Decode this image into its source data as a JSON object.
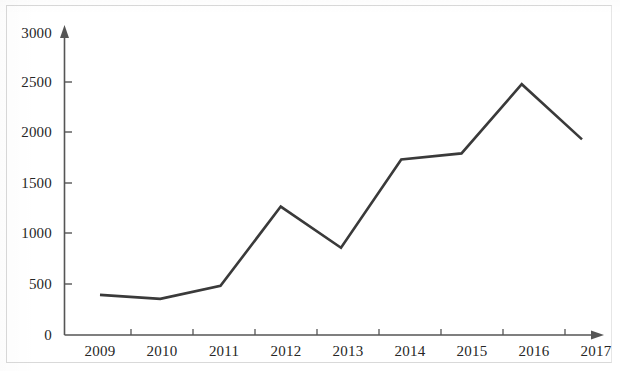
{
  "chart_data": {
    "type": "line",
    "title": "",
    "subtitle": "",
    "xlabel": "",
    "ylabel": "",
    "categories": [
      "2009",
      "2010",
      "2011",
      "2012",
      "2013",
      "2014",
      "2015",
      "2016",
      "2017"
    ],
    "values": [
      400,
      360,
      490,
      1280,
      870,
      1750,
      1810,
      2500,
      1950
    ],
    "series": [
      {
        "name": "",
        "values": [
          400,
          360,
          490,
          1280,
          870,
          1750,
          1810,
          2500,
          1950
        ]
      }
    ],
    "ylim": [
      0,
      3000
    ],
    "ytick_labels": [
      "0",
      "500",
      "1000",
      "1500",
      "2000",
      "2500",
      "3000"
    ],
    "ytick_values": [
      0,
      500,
      1000,
      1500,
      2000,
      2500,
      3000
    ],
    "xtick_labels": [
      "2009",
      "2010",
      "2011",
      "2012",
      "2013",
      "2014",
      "2015",
      "2016",
      "2017"
    ],
    "grid": false,
    "legend": false,
    "legend_position": "none",
    "annotations": [],
    "line_color": "#3a3a3a",
    "axis_color": "#555555",
    "background_color": "#ffffff",
    "axis_arrows": true,
    "marker": "none"
  },
  "axes": {
    "y_ticks": [
      {
        "label": "3000",
        "value": 3000
      },
      {
        "label": "2500",
        "value": 2500
      },
      {
        "label": "2000",
        "value": 2000
      },
      {
        "label": "1500",
        "value": 1500
      },
      {
        "label": "1000",
        "value": 1000
      },
      {
        "label": "500",
        "value": 500
      },
      {
        "label": "0",
        "value": 0
      }
    ],
    "x_ticks": [
      {
        "label": "2009"
      },
      {
        "label": "2010"
      },
      {
        "label": "2011"
      },
      {
        "label": "2012"
      },
      {
        "label": "2013"
      },
      {
        "label": "2014"
      },
      {
        "label": "2015"
      },
      {
        "label": "2016"
      },
      {
        "label": "2017"
      }
    ]
  }
}
